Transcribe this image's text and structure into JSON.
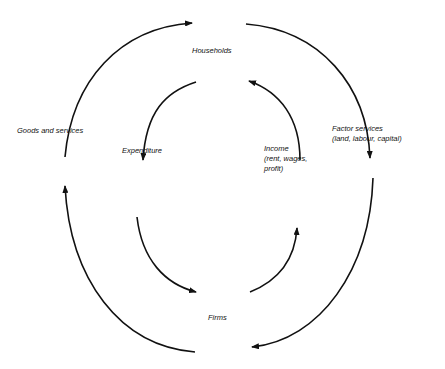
{
  "diagram": {
    "stroke_color": "#111111",
    "background": "#ffffff",
    "nodes": {
      "households": "Households",
      "firms": "Firms"
    },
    "outer_flows": {
      "goods_and_services": "Goods and services",
      "factor_services": {
        "line1": "Factor services",
        "line2": "(land, labour, capital)"
      }
    },
    "inner_flows": {
      "expenditure": "Expenditure",
      "income": {
        "line1": "Income",
        "line2": "(rent, wages,",
        "line3": "profit)"
      }
    },
    "arrows": [
      {
        "id": "goods-to-households",
        "ring": "outer",
        "direction": "firms→households (left side, upward)"
      },
      {
        "id": "factor-to-firms",
        "ring": "outer",
        "direction": "households→firms (right side, downward)"
      },
      {
        "id": "expenditure-to-firms",
        "ring": "inner",
        "direction": "households→firms (left side, downward)"
      },
      {
        "id": "income-to-households",
        "ring": "inner",
        "direction": "firms→households (right side, upward)"
      }
    ]
  }
}
